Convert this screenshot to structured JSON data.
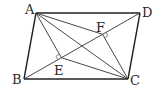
{
  "figure": {
    "type": "parallelogram-with-perpendiculars",
    "points": {
      "A": {
        "label": "A"
      },
      "B": {
        "label": "B"
      },
      "C": {
        "label": "C"
      },
      "D": {
        "label": "D"
      },
      "E": {
        "label": "E"
      },
      "F": {
        "label": "F"
      }
    },
    "segments": [
      "AB",
      "BC",
      "CD",
      "DA",
      "BD",
      "AC",
      "AE",
      "CF",
      "AF",
      "CE"
    ],
    "right_angles": [
      "AE ⟂ BD at E",
      "CF ⟂ BD at F"
    ],
    "stroke_color": "#222222"
  }
}
